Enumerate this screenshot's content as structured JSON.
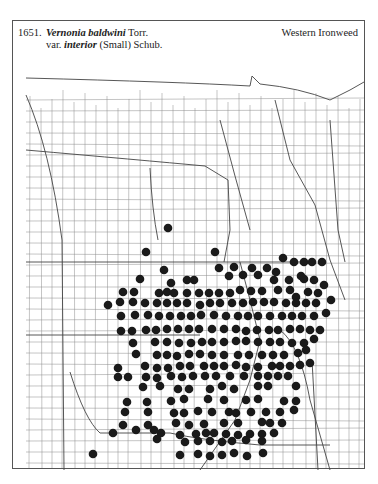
{
  "header": {
    "number": "1651.",
    "genus_species": "Vernonia baldwini",
    "author1": " Torr.",
    "var_prefix": "var. ",
    "variety": "interior",
    "author2": " (Small) Schub.",
    "common_name": "Western Ironweed"
  },
  "map": {
    "dot_color": "#1a1a1a",
    "line_color": "#8a8a8a",
    "dot_radius": 4.3,
    "dots": [
      [
        168,
        228
      ],
      [
        146,
        252
      ],
      [
        215,
        252
      ],
      [
        164,
        270
      ],
      [
        219,
        268
      ],
      [
        234,
        267
      ],
      [
        252,
        268
      ],
      [
        267,
        268
      ],
      [
        283,
        258
      ],
      [
        294,
        262
      ],
      [
        304,
        262
      ],
      [
        312,
        262
      ],
      [
        322,
        262
      ],
      [
        276,
        272
      ],
      [
        301,
        276
      ],
      [
        140,
        279
      ],
      [
        171,
        283
      ],
      [
        187,
        280
      ],
      [
        194,
        280
      ],
      [
        229,
        276
      ],
      [
        243,
        275
      ],
      [
        258,
        275
      ],
      [
        274,
        280
      ],
      [
        289,
        280
      ],
      [
        304,
        279
      ],
      [
        314,
        280
      ],
      [
        324,
        285
      ],
      [
        123,
        292
      ],
      [
        134,
        292
      ],
      [
        159,
        293
      ],
      [
        167,
        292
      ],
      [
        174,
        293
      ],
      [
        187,
        293
      ],
      [
        199,
        293
      ],
      [
        209,
        293
      ],
      [
        219,
        293
      ],
      [
        230,
        293
      ],
      [
        240,
        290
      ],
      [
        251,
        291
      ],
      [
        262,
        291
      ],
      [
        278,
        290
      ],
      [
        290,
        290
      ],
      [
        296,
        297
      ],
      [
        308,
        292
      ],
      [
        318,
        293
      ],
      [
        331,
        300
      ],
      [
        108,
        305
      ],
      [
        120,
        302
      ],
      [
        133,
        302
      ],
      [
        145,
        303
      ],
      [
        157,
        303
      ],
      [
        167,
        303
      ],
      [
        177,
        303
      ],
      [
        187,
        303
      ],
      [
        200,
        305
      ],
      [
        210,
        303
      ],
      [
        220,
        303
      ],
      [
        232,
        303
      ],
      [
        243,
        303
      ],
      [
        253,
        302
      ],
      [
        264,
        302
      ],
      [
        274,
        302
      ],
      [
        286,
        303
      ],
      [
        296,
        303
      ],
      [
        306,
        303
      ],
      [
        316,
        303
      ],
      [
        121,
        316
      ],
      [
        135,
        315
      ],
      [
        148,
        315
      ],
      [
        159,
        316
      ],
      [
        170,
        316
      ],
      [
        181,
        316
      ],
      [
        191,
        316
      ],
      [
        201,
        315
      ],
      [
        214,
        315
      ],
      [
        226,
        316
      ],
      [
        238,
        316
      ],
      [
        248,
        316
      ],
      [
        258,
        316
      ],
      [
        270,
        316
      ],
      [
        282,
        316
      ],
      [
        292,
        316
      ],
      [
        302,
        316
      ],
      [
        314,
        316
      ],
      [
        326,
        313
      ],
      [
        121,
        331
      ],
      [
        132,
        331
      ],
      [
        146,
        330
      ],
      [
        156,
        330
      ],
      [
        167,
        329
      ],
      [
        178,
        329
      ],
      [
        189,
        329
      ],
      [
        199,
        329
      ],
      [
        212,
        329
      ],
      [
        224,
        329
      ],
      [
        236,
        329
      ],
      [
        246,
        331
      ],
      [
        257,
        330
      ],
      [
        269,
        330
      ],
      [
        278,
        330
      ],
      [
        290,
        329
      ],
      [
        300,
        329
      ],
      [
        310,
        330
      ],
      [
        320,
        330
      ],
      [
        133,
        343
      ],
      [
        155,
        342
      ],
      [
        167,
        342
      ],
      [
        179,
        343
      ],
      [
        191,
        343
      ],
      [
        202,
        342
      ],
      [
        212,
        342
      ],
      [
        224,
        342
      ],
      [
        236,
        341
      ],
      [
        246,
        341
      ],
      [
        258,
        342
      ],
      [
        270,
        342
      ],
      [
        280,
        342
      ],
      [
        292,
        343
      ],
      [
        304,
        343
      ],
      [
        314,
        339
      ],
      [
        136,
        354
      ],
      [
        157,
        355
      ],
      [
        167,
        355
      ],
      [
        177,
        356
      ],
      [
        189,
        354
      ],
      [
        200,
        354
      ],
      [
        212,
        355
      ],
      [
        224,
        355
      ],
      [
        238,
        355
      ],
      [
        249,
        355
      ],
      [
        262,
        355
      ],
      [
        273,
        355
      ],
      [
        284,
        355
      ],
      [
        298,
        353
      ],
      [
        306,
        350
      ],
      [
        118,
        368
      ],
      [
        145,
        366
      ],
      [
        157,
        368
      ],
      [
        168,
        368
      ],
      [
        180,
        366
      ],
      [
        190,
        366
      ],
      [
        204,
        366
      ],
      [
        214,
        366
      ],
      [
        224,
        366
      ],
      [
        236,
        365
      ],
      [
        246,
        367
      ],
      [
        258,
        367
      ],
      [
        272,
        366
      ],
      [
        280,
        366
      ],
      [
        290,
        366
      ],
      [
        300,
        365
      ],
      [
        310,
        363
      ],
      [
        118,
        377
      ],
      [
        128,
        377
      ],
      [
        146,
        377
      ],
      [
        157,
        378
      ],
      [
        171,
        376
      ],
      [
        182,
        377
      ],
      [
        193,
        376
      ],
      [
        205,
        376
      ],
      [
        216,
        376
      ],
      [
        230,
        376
      ],
      [
        244,
        376
      ],
      [
        258,
        376
      ],
      [
        268,
        376
      ],
      [
        278,
        376
      ],
      [
        288,
        376
      ],
      [
        143,
        387
      ],
      [
        160,
        386
      ],
      [
        178,
        389
      ],
      [
        189,
        389
      ],
      [
        210,
        389
      ],
      [
        222,
        386
      ],
      [
        234,
        389
      ],
      [
        258,
        386
      ],
      [
        268,
        386
      ],
      [
        296,
        386
      ],
      [
        127,
        402
      ],
      [
        147,
        402
      ],
      [
        171,
        401
      ],
      [
        184,
        399
      ],
      [
        208,
        399
      ],
      [
        224,
        400
      ],
      [
        246,
        400
      ],
      [
        258,
        399
      ],
      [
        284,
        401
      ],
      [
        296,
        401
      ],
      [
        125,
        412
      ],
      [
        148,
        412
      ],
      [
        174,
        413
      ],
      [
        184,
        413
      ],
      [
        198,
        411
      ],
      [
        212,
        412
      ],
      [
        229,
        412
      ],
      [
        236,
        413
      ],
      [
        251,
        412
      ],
      [
        266,
        412
      ],
      [
        280,
        412
      ],
      [
        294,
        410
      ],
      [
        123,
        425
      ],
      [
        148,
        425
      ],
      [
        176,
        423
      ],
      [
        189,
        425
      ],
      [
        204,
        424
      ],
      [
        224,
        423
      ],
      [
        238,
        423
      ],
      [
        262,
        422
      ],
      [
        270,
        423
      ],
      [
        282,
        423
      ],
      [
        113,
        433
      ],
      [
        136,
        430
      ],
      [
        154,
        430
      ],
      [
        161,
        433
      ],
      [
        180,
        435
      ],
      [
        196,
        434
      ],
      [
        206,
        433
      ],
      [
        214,
        433
      ],
      [
        226,
        434
      ],
      [
        238,
        435
      ],
      [
        250,
        434
      ],
      [
        262,
        434
      ],
      [
        274,
        433
      ],
      [
        157,
        439
      ],
      [
        185,
        442
      ],
      [
        198,
        441
      ],
      [
        210,
        441
      ],
      [
        222,
        442
      ],
      [
        232,
        441
      ],
      [
        246,
        440
      ],
      [
        262,
        441
      ],
      [
        93,
        454
      ],
      [
        180,
        455
      ],
      [
        198,
        454
      ],
      [
        210,
        456
      ],
      [
        222,
        455
      ],
      [
        234,
        453
      ],
      [
        247,
        456
      ],
      [
        263,
        453
      ]
    ]
  }
}
